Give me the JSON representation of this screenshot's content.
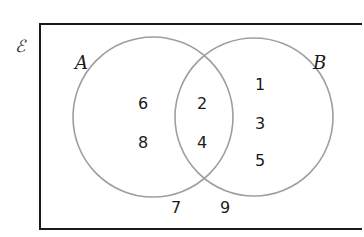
{
  "diagram": {
    "type": "venn",
    "universal_symbol": "ℰ",
    "sets": [
      {
        "label": "A",
        "only": [
          "6",
          "8"
        ]
      },
      {
        "label": "B",
        "only": [
          "1",
          "3",
          "5"
        ]
      }
    ],
    "intersection": [
      "2",
      "4"
    ],
    "outside": [
      "7",
      "9"
    ],
    "colors": {
      "frame": "#1a1a1a",
      "circle": "#9e9e9e",
      "text": "#1a1a1a"
    }
  }
}
